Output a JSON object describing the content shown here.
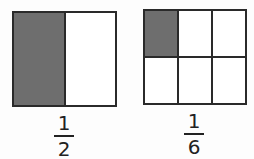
{
  "models": [
    {
      "id": "half",
      "cols": 2,
      "rows": 1,
      "shaded": [
        0
      ],
      "numerator": "1",
      "denominator": "2"
    },
    {
      "id": "sixth",
      "cols": 3,
      "rows": 2,
      "shaded": [
        0
      ],
      "numerator": "1",
      "denominator": "6"
    }
  ],
  "colors": {
    "shade": "#6e6e6e",
    "line": "#2a2a2a"
  }
}
